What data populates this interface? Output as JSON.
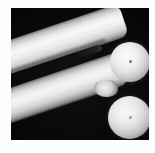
{
  "figure": {
    "kind": "grayscale-micrograph",
    "caption": "",
    "background_color": "#050505",
    "page_color": "#ffffff",
    "highlight_color": "#f4f4f4",
    "shadow_color": "#040404",
    "plate": {
      "left": 11,
      "top": 8,
      "width": 138,
      "height": 132
    },
    "objects": [
      {
        "name": "upper-prong",
        "type": "tapered-bar",
        "angle_deg": -18.5,
        "brightness": "bright"
      },
      {
        "name": "lower-prong",
        "type": "tapered-bar",
        "angle_deg": -18.5,
        "brightness": "bright"
      },
      {
        "name": "slit",
        "type": "dark-wedge-gap",
        "angle_deg": -18.5,
        "brightness": "black"
      },
      {
        "name": "waist",
        "type": "neck-junction",
        "brightness": "mid"
      },
      {
        "name": "upper-ball-tip",
        "type": "sphere",
        "center_x": 119,
        "center_y": 54,
        "radius": 20
      },
      {
        "name": "lower-ball-tip",
        "type": "sphere",
        "center_x": 118,
        "center_y": 109,
        "radius": 21
      }
    ]
  }
}
